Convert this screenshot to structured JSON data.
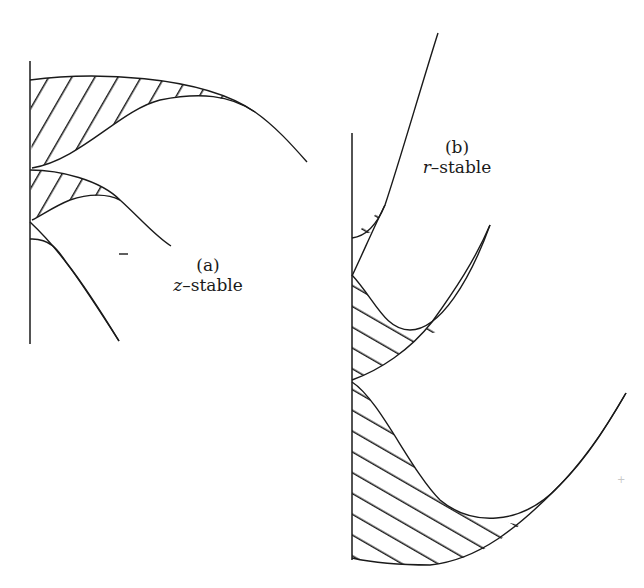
{
  "figure": {
    "panels": [
      {
        "id": "a",
        "tag": "(a)",
        "var": "z",
        "dash": "–",
        "word": "stable",
        "caption": "z–stable",
        "description": "z-stable regions: three hatched lobes attached to vertical axis, curves descending to the right"
      },
      {
        "id": "b",
        "tag": "(b)",
        "var": "r",
        "dash": "–",
        "word": "stable",
        "caption": "r–stable",
        "description": "r-stable regions: three hatched lobes attached to vertical axis, curves rising to the right"
      }
    ],
    "minus_mark": "–",
    "colors": {
      "line": "#1a1a1a",
      "background": "#ffffff"
    }
  }
}
